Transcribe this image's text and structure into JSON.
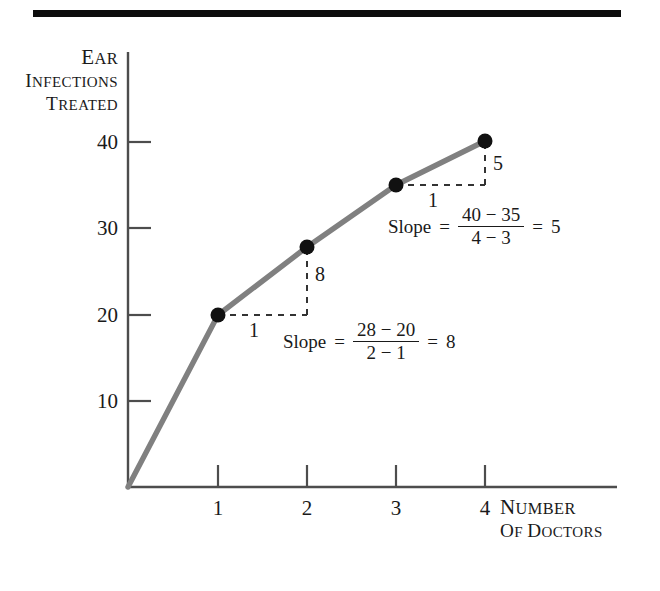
{
  "figure": {
    "top_rule": true
  },
  "chart_data": {
    "type": "line",
    "title": "",
    "xlabel_line1": "Number",
    "xlabel_line2": "of Doctors",
    "ylabel_line1": "Ear",
    "ylabel_line2": "Infections",
    "ylabel_line3": "Treated",
    "x": [
      0,
      1,
      2,
      3,
      4
    ],
    "values": [
      0,
      20,
      28,
      35,
      40
    ],
    "xticks": [
      "1",
      "2",
      "3",
      "4"
    ],
    "xtick_values": [
      1,
      2,
      3,
      4
    ],
    "yticks": [
      "10",
      "20",
      "30",
      "40"
    ],
    "ytick_values": [
      10,
      20,
      30,
      40
    ],
    "xlim": [
      0,
      5.45
    ],
    "ylim": [
      0,
      48
    ],
    "grid": false,
    "legend": "none",
    "line_color": "#808080",
    "marker_color": "#111111",
    "axis_color": "#4d4d4d",
    "points_marked": [
      {
        "x": 1,
        "y": 20
      },
      {
        "x": 2,
        "y": 28
      },
      {
        "x": 3,
        "y": 35
      },
      {
        "x": 4,
        "y": 40
      }
    ],
    "annotations": [
      {
        "id": "slope-1-2",
        "rise": "8",
        "run": "1",
        "word": "Slope",
        "equals": "=",
        "numerator": "28 − 20",
        "denominator": "2 − 1",
        "result_equals": "=",
        "result": "8"
      },
      {
        "id": "slope-3-4",
        "rise": "5",
        "run": "1",
        "word": "Slope",
        "equals": "=",
        "numerator": "40 − 35",
        "denominator": "4 − 3",
        "result_equals": "=",
        "result": "5"
      }
    ]
  }
}
